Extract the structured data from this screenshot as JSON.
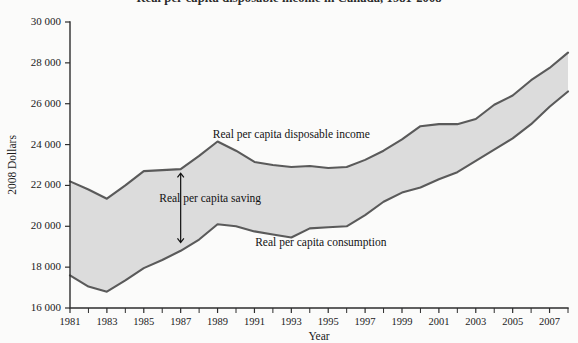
{
  "title": "Real per capita disposable income in Canada, 1981-2008",
  "chart_data": {
    "type": "area",
    "title": "Real per capita disposable income in Canada, 1981-2008",
    "xlabel": "Year",
    "ylabel": "2008 Dollars",
    "xlim": [
      1981,
      2008
    ],
    "ylim": [
      16000,
      30000
    ],
    "ytick_step": 2000,
    "grid": false,
    "legend_position": "inline-annotations",
    "x": [
      1981,
      1982,
      1983,
      1984,
      1985,
      1986,
      1987,
      1988,
      1989,
      1990,
      1991,
      1992,
      1993,
      1994,
      1995,
      1996,
      1997,
      1998,
      1999,
      2000,
      2001,
      2002,
      2003,
      2004,
      2005,
      2006,
      2007,
      2008
    ],
    "series": [
      {
        "name": "Real per capita disposable income",
        "values": [
          22200,
          21800,
          21350,
          22000,
          22700,
          22750,
          22800,
          23450,
          24150,
          23700,
          23150,
          23000,
          22900,
          22950,
          22850,
          22900,
          23250,
          23700,
          24250,
          24900,
          25000,
          25000,
          25250,
          25950,
          26400,
          27150,
          27750,
          28500
        ]
      },
      {
        "name": "Real per capita consumption",
        "values": [
          17600,
          17050,
          16800,
          17350,
          17950,
          18350,
          18800,
          19350,
          20100,
          20000,
          19750,
          19600,
          19450,
          19900,
          19950,
          20000,
          20550,
          21200,
          21650,
          21900,
          22300,
          22650,
          23200,
          23750,
          24300,
          25000,
          25850,
          26600
        ]
      }
    ],
    "annotations": [
      {
        "name": "income-label",
        "text": "Real per capita disposable income",
        "x": 1993.0,
        "y": 24300
      },
      {
        "name": "saving-label",
        "text": "Real per capita saving",
        "x": 1988.6,
        "y": 21200
      },
      {
        "name": "consumption-label",
        "text": "Real per capita consumption",
        "x": 1994.6,
        "y": 19050
      },
      {
        "name": "saving-arrow",
        "text": "",
        "x": 1987.0,
        "y_top": 22600,
        "y_bottom": 19200
      }
    ],
    "xtick_labels": [
      "1981",
      "1983",
      "1985",
      "1987",
      "1989",
      "1991",
      "1993",
      "1995",
      "1997",
      "1999",
      "2001",
      "2003",
      "2005",
      "2007"
    ],
    "ytick_labels": [
      "16 000",
      "18 000",
      "20 000",
      "22 000",
      "24 000",
      "26 000",
      "28 000",
      "30 000"
    ]
  },
  "colors": {
    "band_fill": "#dcdcdc",
    "line": "#5a5a5a",
    "axis": "#2e2e2e",
    "text": "#1a1a1a",
    "background": "#fbfbfa"
  }
}
